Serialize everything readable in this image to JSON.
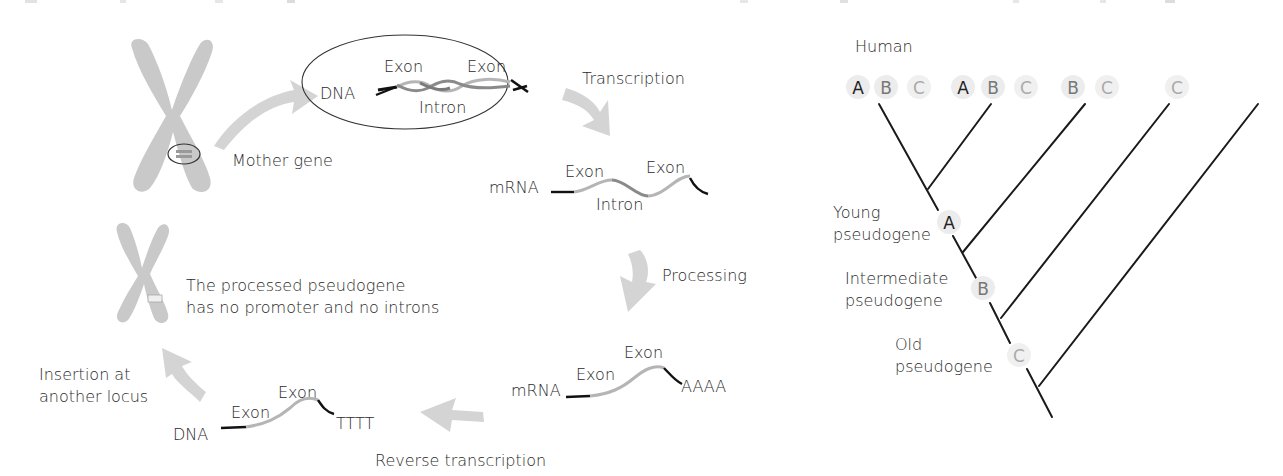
{
  "figure": {
    "colors": {
      "chromosome": "#c9c9c9",
      "arrow": "#d4d4d4",
      "exon_strand": "#b5b5b5",
      "intron_strand": "#8a8a8a",
      "terminal": "#1a1a1a",
      "tree_line": "#1a1a1a",
      "circle_bg": "#ececec",
      "letter_dark": "#222222",
      "letter_mid": "#777777",
      "letter_light": "#aaaaaa"
    },
    "left_panel": {
      "mother_gene_label": "Mother gene",
      "dna_box": {
        "dna_label": "DNA",
        "exon1_label": "Exon",
        "exon2_label": "Exon",
        "intron_label": "Intron"
      },
      "transcription_label": "Transcription",
      "mrna_precursor": {
        "mrna_label": "mRNA",
        "exon1_label": "Exon",
        "exon2_label": "Exon",
        "intron_label": "Intron"
      },
      "processing_label": "Processing",
      "mrna_processed": {
        "mrna_label": "mRNA",
        "exon1_label": "Exon",
        "exon2_label": "Exon",
        "polya_label": "AAAA"
      },
      "reverse_transcription_label": "Reverse transcription",
      "cdna": {
        "dna_label": "DNA",
        "exon1_label": "Exon",
        "exon2_label": "Exon",
        "polyt_label": "TTTT"
      },
      "insertion_label_line1": "Insertion at",
      "insertion_label_line2": "another locus",
      "pseudogene_note_line1": "The processed pseudogene",
      "pseudogene_note_line2": "has no promoter and no introns"
    },
    "right_panel": {
      "species_label": "Human",
      "tip_groups": [
        {
          "letters": [
            "A",
            "B",
            "C"
          ]
        },
        {
          "letters": [
            "A",
            "B",
            "C"
          ]
        },
        {
          "letters": [
            "B",
            "C"
          ]
        },
        {
          "letters": [
            "C"
          ]
        },
        {
          "letters": []
        }
      ],
      "tip_letters": [
        "A",
        "B",
        "C",
        "A",
        "B",
        "C",
        "B",
        "C",
        "C"
      ],
      "nodes": [
        {
          "letter": "A",
          "label_line1": "Young",
          "label_line2": "pseudogene"
        },
        {
          "letter": "B",
          "label_line1": "Intermediate",
          "label_line2": "pseudogene"
        },
        {
          "letter": "C",
          "label_line1": "Old",
          "label_line2": "pseudogene"
        }
      ]
    }
  }
}
